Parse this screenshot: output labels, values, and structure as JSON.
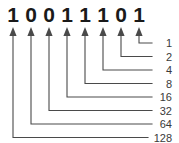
{
  "diagram": {
    "binary_string": "10011101",
    "bits": [
      {
        "digit": "1",
        "place_value": "128"
      },
      {
        "digit": "0",
        "place_value": "64"
      },
      {
        "digit": "0",
        "place_value": "32"
      },
      {
        "digit": "1",
        "place_value": "16"
      },
      {
        "digit": "1",
        "place_value": "8"
      },
      {
        "digit": "1",
        "place_value": "4"
      },
      {
        "digit": "0",
        "place_value": "2"
      },
      {
        "digit": "1",
        "place_value": "1"
      }
    ],
    "place_values_top_to_bottom": [
      "1",
      "2",
      "4",
      "8",
      "16",
      "32",
      "64",
      "128"
    ],
    "colors": {
      "background": "#ffffff",
      "digit": "#1a1a1a",
      "line": "#4a4a4a",
      "label": "#3a3a3a"
    }
  }
}
